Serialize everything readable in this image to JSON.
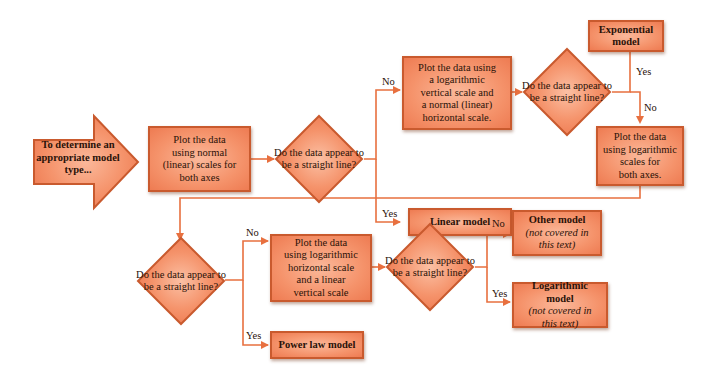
{
  "colors": {
    "box_fill": "#f5936b",
    "box_border": "#c95a2e",
    "connector": "#e8703f",
    "text": "#2a1208"
  },
  "start": {
    "lines": [
      "To determine an",
      "appropriate model",
      "type..."
    ]
  },
  "step1": {
    "lines": [
      "Plot the data",
      "using normal",
      "(linear) scales for",
      "both axes"
    ]
  },
  "decision1": {
    "lines": [
      "Do the",
      "data appear",
      "to be a straight",
      "line?"
    ]
  },
  "linear_model": {
    "label": "Linear model"
  },
  "step2": {
    "lines": [
      "Plot the data using",
      "a logarithmic",
      "vertical scale and",
      "a normal (linear)",
      "horizontal scale."
    ]
  },
  "decision2": {
    "lines": [
      "Do the",
      "data appear",
      "to be a straight",
      "line?"
    ]
  },
  "exponential_model": {
    "lines": [
      "Exponential",
      "model"
    ]
  },
  "step3": {
    "lines": [
      "Plot the data",
      "using logarithmic",
      "scales for",
      "both axes."
    ]
  },
  "decision3": {
    "lines": [
      "Do the",
      "data appear",
      "to be a straight",
      "line?"
    ]
  },
  "power_law_model": {
    "label": "Power law model"
  },
  "step4": {
    "lines": [
      "Plot the data",
      "using logarithmic",
      "horizontal scale",
      "and a linear",
      "vertical scale"
    ]
  },
  "decision4": {
    "lines": [
      "Do the",
      "data appear",
      "to be a straight",
      "line?"
    ]
  },
  "other_model": {
    "title": "Other model",
    "note_lines": [
      "(not covered in",
      "this text)"
    ]
  },
  "logarithmic_model": {
    "title": "Logarithmic model",
    "note_lines": [
      "(not covered in",
      "this text)"
    ]
  },
  "labels": {
    "yes": "Yes",
    "no": "No"
  }
}
